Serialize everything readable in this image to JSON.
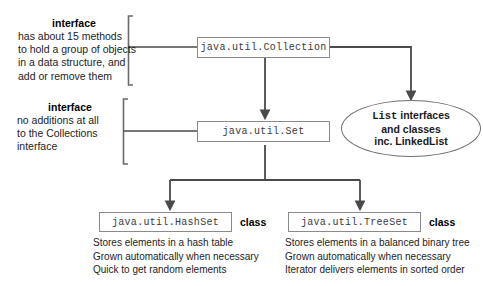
{
  "diagram": {
    "title_text": "Java Collections hierarchy diagram",
    "colors": {
      "line": "#4a4a4a",
      "box_border": "#8a8a8a",
      "text": "#1d1d1d",
      "mono_text": "#3a3a3a",
      "background": "#ffffff"
    },
    "nodes": {
      "collection": {
        "label": "java.util.Collection",
        "kind_label": ""
      },
      "set": {
        "label": "java.util.Set",
        "kind_label": ""
      },
      "hashset": {
        "label": "java.util.HashSet",
        "kind_label": "class"
      },
      "treeset": {
        "label": "java.util.TreeSet",
        "kind_label": "class"
      },
      "list_cloud": {
        "line1_mono": "List",
        "line1_rest": "interfaces",
        "line2": "and classes",
        "line3": "inc. LinkedList"
      }
    },
    "annotations": {
      "collection_note": {
        "title": "interface",
        "lines": [
          "has about 15 methods",
          "to hold a group of objects",
          "in a data structure, and",
          "add or remove them"
        ]
      },
      "set_note": {
        "title": "interface",
        "lines": [
          "no additions at all",
          "to the Collections",
          "interface"
        ]
      }
    },
    "descriptions": {
      "hashset": [
        "Stores elements in a hash table",
        "Grown automatically when necessary",
        "Quick to get random elements"
      ],
      "treeset": [
        "Stores elements in a balanced binary tree",
        "Grown automatically when necessary",
        "Iterator delivers elements in sorted order"
      ]
    }
  }
}
